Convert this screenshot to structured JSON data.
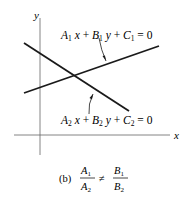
{
  "figure": {
    "axes": {
      "x_label": "x",
      "y_label": "y"
    },
    "lines": [
      {
        "id": "line1",
        "equation": {
          "A": "A",
          "sub": "1",
          "B": "B",
          "C": "C",
          "rhs": "0"
        },
        "label": "A1x + B1y + C1 = 0"
      },
      {
        "id": "line2",
        "equation": {
          "A": "A",
          "sub": "2",
          "B": "B",
          "C": "C",
          "rhs": "0"
        },
        "label": "A2x + B2y + C2 = 0"
      }
    ],
    "caption": {
      "tag": "(b)",
      "num_left": "A",
      "num_left_sub": "1",
      "den_left": "A",
      "den_left_sub": "2",
      "relation": "≠",
      "num_right": "B",
      "num_right_sub": "1",
      "den_right": "B",
      "den_right_sub": "2"
    },
    "colors": {
      "ink": "#1a1a1a",
      "axis": "#555555"
    }
  }
}
